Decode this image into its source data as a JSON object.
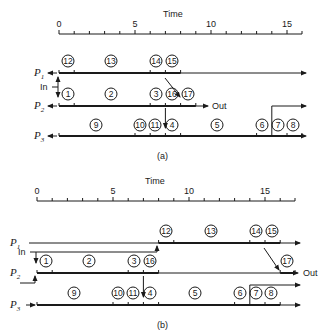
{
  "diagrams": [
    {
      "id": "a",
      "caption": "(a)",
      "axis": {
        "title": "Time",
        "ticks": [
          {
            "v": 0,
            "label": "0"
          },
          {
            "v": 5,
            "label": "5"
          },
          {
            "v": 10,
            "label": "10"
          },
          {
            "v": 15,
            "label": "15"
          }
        ],
        "max": 16
      },
      "labels": {
        "in": "In",
        "out": "Out"
      },
      "processors": [
        {
          "name": "P",
          "sub": "1",
          "tasks": [
            {
              "id": "12",
              "start": 0,
              "end": 1
            },
            {
              "id": "13",
              "start": 1,
              "end": 6
            },
            {
              "id": "14",
              "start": 6,
              "end": 7
            },
            {
              "id": "15",
              "start": 7,
              "end": 8
            }
          ]
        },
        {
          "name": "P",
          "sub": "2",
          "tasks": [
            {
              "id": "1",
              "start": 0,
              "end": 1
            },
            {
              "id": "2",
              "start": 1,
              "end": 6
            },
            {
              "id": "3",
              "start": 6,
              "end": 7
            },
            {
              "id": "16",
              "start": 7,
              "end": 8
            },
            {
              "id": "17",
              "start": 8,
              "end": 9
            }
          ]
        },
        {
          "name": "P",
          "sub": "3",
          "tasks": [
            {
              "id": "9",
              "start": 0,
              "end": 5
            },
            {
              "id": "10",
              "start": 5,
              "end": 6
            },
            {
              "id": "11",
              "start": 6,
              "end": 7
            },
            {
              "id": "4",
              "start": 7,
              "end": 8
            },
            {
              "id": "5",
              "start": 8,
              "end": 13
            },
            {
              "id": "6",
              "start": 13,
              "end": 14
            },
            {
              "id": "7",
              "start": 14,
              "end": 15
            },
            {
              "id": "8",
              "start": 15,
              "end": 16
            }
          ]
        }
      ]
    },
    {
      "id": "b",
      "caption": "(b)",
      "axis": {
        "title": "Time",
        "ticks": [
          {
            "v": 0,
            "label": "0"
          },
          {
            "v": 5,
            "label": "5"
          },
          {
            "v": 10,
            "label": "10"
          },
          {
            "v": 15,
            "label": "15"
          }
        ],
        "max": 17
      },
      "labels": {
        "in": "In",
        "out": "Out"
      },
      "processors": [
        {
          "name": "P",
          "sub": "1",
          "tasks": [
            {
              "id": "12",
              "start": 8,
              "end": 9
            },
            {
              "id": "13",
              "start": 9,
              "end": 14
            },
            {
              "id": "14",
              "start": 14,
              "end": 15
            },
            {
              "id": "15",
              "start": 15,
              "end": 16
            }
          ]
        },
        {
          "name": "P",
          "sub": "2",
          "tasks": [
            {
              "id": "1",
              "start": 0,
              "end": 1
            },
            {
              "id": "2",
              "start": 1,
              "end": 6
            },
            {
              "id": "3",
              "start": 6,
              "end": 7
            },
            {
              "id": "16",
              "start": 7,
              "end": 8
            },
            {
              "id": "17",
              "start": 16,
              "end": 17
            }
          ]
        },
        {
          "name": "P",
          "sub": "3",
          "tasks": [
            {
              "id": "9",
              "start": 0,
              "end": 5
            },
            {
              "id": "10",
              "start": 5,
              "end": 6
            },
            {
              "id": "11",
              "start": 6,
              "end": 7
            },
            {
              "id": "4",
              "start": 7,
              "end": 8
            },
            {
              "id": "5",
              "start": 8,
              "end": 13
            },
            {
              "id": "6",
              "start": 13,
              "end": 14
            },
            {
              "id": "7",
              "start": 14,
              "end": 15
            },
            {
              "id": "8",
              "start": 15,
              "end": 16
            }
          ]
        }
      ]
    }
  ]
}
